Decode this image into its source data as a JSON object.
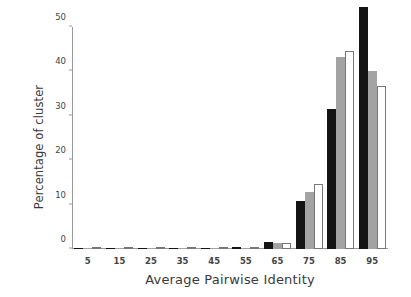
{
  "chart_data": {
    "type": "bar",
    "title": "",
    "subtitle": "",
    "xlabel": "Average Pairwise Identity",
    "ylabel": "Percentage of cluster",
    "categories": [
      "5",
      "15",
      "25",
      "35",
      "45",
      "55",
      "65",
      "75",
      "85",
      "95"
    ],
    "series": [
      {
        "name": "series-black",
        "color": "#141414",
        "values": [
          0,
          0,
          0,
          0,
          0.1,
          0.4,
          1.6,
          10.8,
          31.5,
          54.5
        ]
      },
      {
        "name": "series-gray",
        "color": "#a3a3a3",
        "values": [
          0,
          0,
          0,
          0,
          0.1,
          0.2,
          1.4,
          12.8,
          43.3,
          40.2
        ]
      },
      {
        "name": "series-white",
        "color": "#ffffff",
        "values": [
          0,
          0,
          0,
          0,
          0,
          0.1,
          1.3,
          14.6,
          44.6,
          36.7
        ]
      }
    ],
    "ylim": [
      0,
      50
    ],
    "yticks": [
      0,
      10,
      20,
      30,
      40,
      50
    ],
    "ytick_labels": [
      "0",
      "10",
      "20",
      "30",
      "40",
      "50"
    ],
    "xtick_labels": [
      "5",
      "15",
      "25",
      "35",
      "45",
      "55",
      "65",
      "75",
      "85",
      "95"
    ],
    "grid": false,
    "legend": "none",
    "axis_color": "#9a9a9a",
    "text_color": "#3a3a3a",
    "background": "#ffffff"
  }
}
